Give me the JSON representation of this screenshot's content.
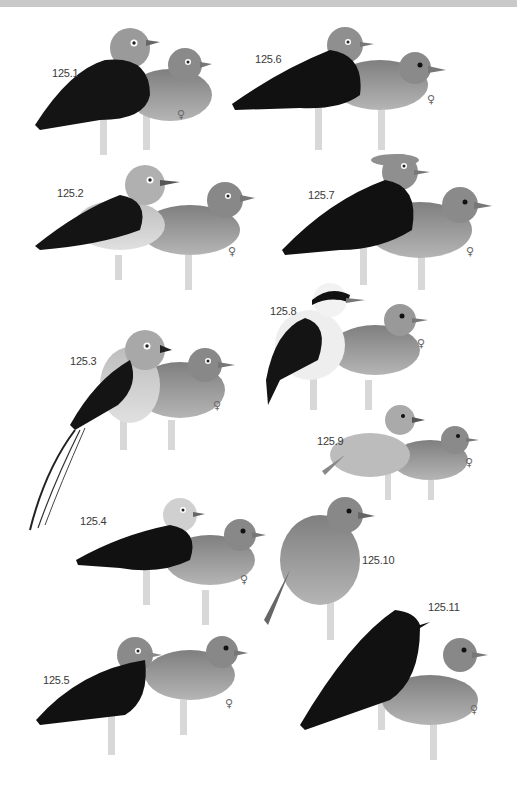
{
  "plate": {
    "colors": {
      "background": "#ffffff",
      "top_band": "#c9c9c9",
      "male_black": "#141414",
      "male_head_gray": "#8f8f8f",
      "female_body": "#8a8a8a",
      "perch": "#d9d9d9"
    },
    "female_symbol": "♀",
    "entries": [
      {
        "id": "125.1",
        "label": "125.1",
        "has_female": true
      },
      {
        "id": "125.2",
        "label": "125.2",
        "has_female": true
      },
      {
        "id": "125.3",
        "label": "125.3",
        "has_female": true
      },
      {
        "id": "125.4",
        "label": "125.4",
        "has_female": true
      },
      {
        "id": "125.5",
        "label": "125.5",
        "has_female": true
      },
      {
        "id": "125.6",
        "label": "125.6",
        "has_female": true
      },
      {
        "id": "125.7",
        "label": "125.7",
        "has_female": true
      },
      {
        "id": "125.8",
        "label": "125.8",
        "has_female": true
      },
      {
        "id": "125.9",
        "label": "125.9",
        "has_female": true
      },
      {
        "id": "125.10",
        "label": "125.10",
        "has_female": false
      },
      {
        "id": "125.11",
        "label": "125.11",
        "has_female": true
      }
    ]
  }
}
